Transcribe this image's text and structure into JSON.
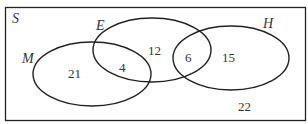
{
  "diagram": {
    "type": "venn",
    "universal_set": "S",
    "sets": [
      {
        "name": "M",
        "cx": 92,
        "cy": 74,
        "rx": 59,
        "ry": 32
      },
      {
        "name": "E",
        "cx": 152,
        "cy": 50,
        "rx": 59,
        "ry": 32
      },
      {
        "name": "H",
        "cx": 231,
        "cy": 58,
        "rx": 58,
        "ry": 32
      }
    ],
    "labels": {
      "S": "S",
      "M": "M",
      "E": "E",
      "H": "H"
    },
    "regions": {
      "M_only": "21",
      "M_and_E": "4",
      "E_only": "12",
      "E_and_H": "6",
      "H_only": "15",
      "outside": "22"
    },
    "colors": {
      "stroke": "#222222",
      "text": "#333333",
      "background": "#ffffff"
    }
  }
}
